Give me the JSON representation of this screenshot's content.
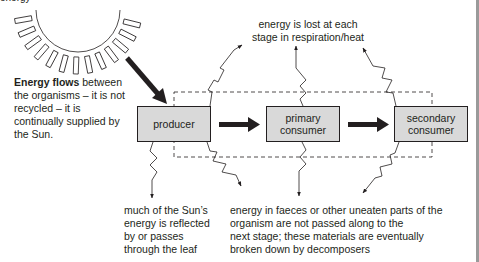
{
  "top_cut_label": "energy",
  "sun": {
    "icon": "sun-icon"
  },
  "left_note": {
    "bold": "Energy flows",
    "rest": " between the organisms – it is not recycled – it is continually supplied by the Sun."
  },
  "top_note": {
    "line1": "energy is lost at each",
    "line2": "stage in respiration/heat"
  },
  "boxes": [
    {
      "label_line1": "producer",
      "label_line2": ""
    },
    {
      "label_line1": "primary",
      "label_line2": "consumer"
    },
    {
      "label_line1": "secondary",
      "label_line2": "consumer"
    }
  ],
  "bottom_left_note": {
    "line1": "much of the Sun’s",
    "line2": "energy is reflected",
    "line3": "by or passes",
    "line4": "through the leaf"
  },
  "bottom_right_note": {
    "line1": "energy in faeces or other uneaten parts of the",
    "line2": "organism are not passed along to the",
    "line3": "next stage; these materials are eventually",
    "line4": "broken down by decomposers"
  },
  "colors": {
    "box_fill": "#d9d9d9",
    "line": "#231f20",
    "rule": "#9a9a9a"
  }
}
